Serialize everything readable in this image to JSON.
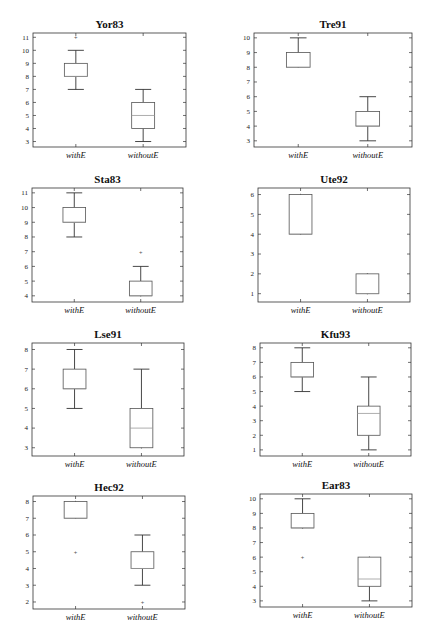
{
  "chart_data": [
    {
      "type": "box",
      "title": "Yor83",
      "categories": [
        "withE",
        "withoutE"
      ],
      "ylim": [
        3,
        11
      ],
      "yticks": [
        3,
        4,
        5,
        6,
        7,
        8,
        9,
        10,
        11
      ],
      "series": [
        {
          "name": "withE",
          "whisker_low": 7,
          "q1": 8,
          "median": 8,
          "q3": 9,
          "whisker_high": 10,
          "outliers": [
            11
          ]
        },
        {
          "name": "withoutE",
          "whisker_low": 3,
          "q1": 4,
          "median": 5,
          "q3": 6,
          "whisker_high": 7,
          "outliers": []
        }
      ]
    },
    {
      "type": "box",
      "title": "Tre91",
      "categories": [
        "withE",
        "withoutE"
      ],
      "ylim": [
        3,
        10
      ],
      "yticks": [
        3,
        4,
        5,
        6,
        7,
        8,
        9,
        10
      ],
      "series": [
        {
          "name": "withE",
          "whisker_low": 8,
          "q1": 8,
          "median": 8,
          "q3": 9,
          "whisker_high": 10,
          "outliers": []
        },
        {
          "name": "withoutE",
          "whisker_low": 3,
          "q1": 4,
          "median": 4,
          "q3": 5,
          "whisker_high": 6,
          "outliers": []
        }
      ]
    },
    {
      "type": "box",
      "title": "Sta83",
      "categories": [
        "withE",
        "withoutE"
      ],
      "ylim": [
        4,
        11
      ],
      "yticks": [
        4,
        5,
        6,
        7,
        8,
        9,
        10,
        11
      ],
      "series": [
        {
          "name": "withE",
          "whisker_low": 8,
          "q1": 9,
          "median": 9,
          "q3": 10,
          "whisker_high": 11,
          "outliers": []
        },
        {
          "name": "withoutE",
          "whisker_low": 4,
          "q1": 4,
          "median": 4,
          "q3": 5,
          "whisker_high": 6,
          "outliers": [
            7
          ]
        }
      ]
    },
    {
      "type": "box",
      "title": "Ute92",
      "categories": [
        "withE",
        "withoutE"
      ],
      "ylim": [
        1,
        6
      ],
      "yticks": [
        1,
        2,
        3,
        4,
        5,
        6
      ],
      "series": [
        {
          "name": "withE",
          "whisker_low": 4,
          "q1": 4,
          "median": 4,
          "q3": 6,
          "whisker_high": 6,
          "outliers": []
        },
        {
          "name": "withoutE",
          "whisker_low": 1,
          "q1": 1,
          "median": 1,
          "q3": 2,
          "whisker_high": 2,
          "outliers": []
        }
      ]
    },
    {
      "type": "box",
      "title": "Lse91",
      "categories": [
        "withE",
        "withoutE"
      ],
      "ylim": [
        3,
        8
      ],
      "yticks": [
        3,
        4,
        5,
        6,
        7,
        8
      ],
      "series": [
        {
          "name": "withE",
          "whisker_low": 5,
          "q1": 6,
          "median": 6,
          "q3": 7,
          "whisker_high": 8,
          "outliers": []
        },
        {
          "name": "withoutE",
          "whisker_low": 3,
          "q1": 3,
          "median": 4,
          "q3": 5,
          "whisker_high": 7,
          "outliers": []
        }
      ]
    },
    {
      "type": "box",
      "title": "Kfu93",
      "categories": [
        "withE",
        "withoutE"
      ],
      "ylim": [
        1,
        8
      ],
      "yticks": [
        1,
        2,
        3,
        4,
        5,
        6,
        7,
        8
      ],
      "series": [
        {
          "name": "withE",
          "whisker_low": 5,
          "q1": 6,
          "median": 6,
          "q3": 7,
          "whisker_high": 8,
          "outliers": []
        },
        {
          "name": "withoutE",
          "whisker_low": 1,
          "q1": 2,
          "median": 3.5,
          "q3": 4,
          "whisker_high": 6,
          "outliers": []
        }
      ]
    },
    {
      "type": "box",
      "title": "Hec92",
      "categories": [
        "withE",
        "withoutE"
      ],
      "ylim": [
        2,
        8
      ],
      "yticks": [
        2,
        3,
        4,
        5,
        6,
        7,
        8
      ],
      "series": [
        {
          "name": "withE",
          "whisker_low": 7,
          "q1": 7,
          "median": 7,
          "q3": 8,
          "whisker_high": 8,
          "outliers": [
            5
          ]
        },
        {
          "name": "withoutE",
          "whisker_low": 3,
          "q1": 4,
          "median": 4,
          "q3": 5,
          "whisker_high": 6,
          "outliers": [
            2
          ]
        }
      ]
    },
    {
      "type": "box",
      "title": "Ear83",
      "categories": [
        "withE",
        "withoutE"
      ],
      "ylim": [
        3,
        10
      ],
      "yticks": [
        3,
        4,
        5,
        6,
        7,
        8,
        9,
        10
      ],
      "series": [
        {
          "name": "withE",
          "whisker_low": 8,
          "q1": 8,
          "median": 8,
          "q3": 9,
          "whisker_high": 10,
          "outliers": [
            6
          ]
        },
        {
          "name": "withoutE",
          "whisker_low": 3,
          "q1": 4,
          "median": 4.5,
          "q3": 6,
          "whisker_high": 6,
          "outliers": []
        }
      ]
    }
  ]
}
